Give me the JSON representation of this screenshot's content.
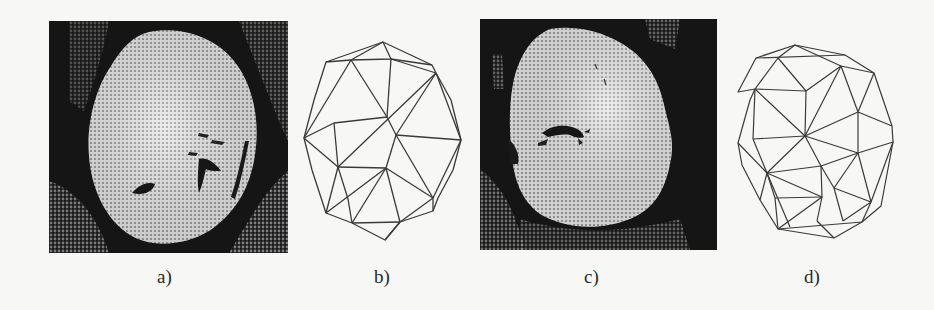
{
  "figure": {
    "panels": [
      {
        "id": "a",
        "label": "a)",
        "kind": "image",
        "description": "Halftone grayscale medical image of an organ cross-section (bright region on dark background)"
      },
      {
        "id": "b",
        "label": "b)",
        "kind": "mesh",
        "description": "Triangulated contour mesh of the organ in a)"
      },
      {
        "id": "c",
        "label": "c)",
        "kind": "image",
        "description": "Halftone grayscale medical image of an organ cross-section (second slice)"
      },
      {
        "id": "d",
        "label": "d)",
        "kind": "mesh",
        "description": "Triangulated contour mesh of the organ in c)"
      }
    ]
  },
  "colors": {
    "paper": "#f7f7f5",
    "ink": "#2a2a2a",
    "photo_dark": "#151515",
    "photo_light": "#e4e4e4",
    "mesh_line": "#3a3a3a"
  }
}
